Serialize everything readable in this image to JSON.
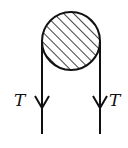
{
  "diagram": {
    "pulley": {
      "cx": 71,
      "cy": 41,
      "r": 29,
      "fill": "hatched",
      "stroke": "#111111"
    },
    "strings": [
      {
        "side": "left",
        "x": 42,
        "y_top": 41,
        "y_bottom": 134
      },
      {
        "side": "right",
        "x": 100,
        "y_top": 41,
        "y_bottom": 134
      }
    ],
    "arrows": [
      {
        "side": "left",
        "direction": "down",
        "x": 42,
        "y_tip": 108
      },
      {
        "side": "right",
        "direction": "down",
        "x": 100,
        "y_tip": 108
      }
    ],
    "labels": {
      "left_tension": "T",
      "right_tension": "T"
    },
    "colors": {
      "ink": "#111111",
      "background": "#ffffff"
    }
  }
}
